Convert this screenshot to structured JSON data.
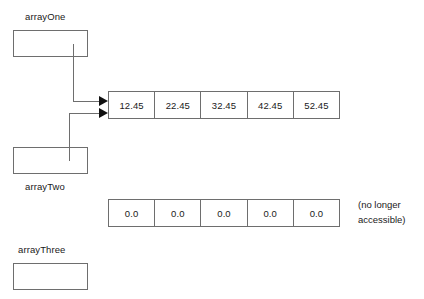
{
  "diagram": {
    "stroke_color": "#6e6e6e",
    "arrow_color": "#111111",
    "text_color": "#1a1a1a",
    "background": "#ffffff"
  },
  "references": [
    {
      "name": "arrayOne",
      "label": "arrayOne",
      "label_position": "above",
      "points_to": "active-array"
    },
    {
      "name": "arrayTwo",
      "label": "arrayTwo",
      "label_position": "below",
      "points_to": "active-array"
    },
    {
      "name": "arrayThree",
      "label": "arrayThree",
      "label_position": "above",
      "points_to": null
    }
  ],
  "arrays": {
    "active": {
      "name": "active-array",
      "values": [
        "12.45",
        "22.45",
        "32.45",
        "42.45",
        "52.45"
      ]
    },
    "orphaned": {
      "name": "orphaned-array",
      "values": [
        "0.0",
        "0.0",
        "0.0",
        "0.0",
        "0.0"
      ],
      "note_line1": "(no longer",
      "note_line2": "accessible)"
    }
  }
}
